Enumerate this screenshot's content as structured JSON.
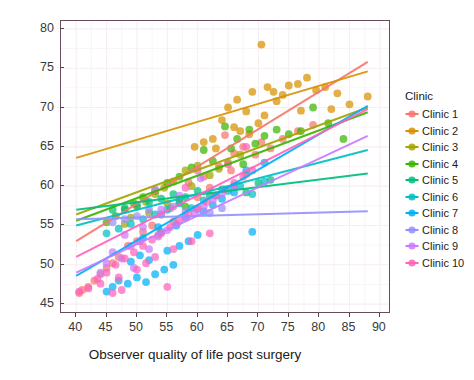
{
  "chart_data": {
    "type": "scatter",
    "title": "",
    "xlabel": "Observer quality of life post surgery",
    "ylabel": "Predicted quality of life post surgery",
    "xlim": [
      37.5,
      91.5
    ],
    "ylim": [
      44.0,
      81.0
    ],
    "xticks": [
      40,
      45,
      50,
      55,
      60,
      65,
      70,
      75,
      80,
      85,
      90
    ],
    "yticks": [
      45,
      50,
      55,
      60,
      65,
      70,
      75,
      80
    ],
    "grid": "minor-and-major faint pink",
    "legend_position": "right",
    "legend_title": "Clinic",
    "panel_border_color": "#6b4a5e",
    "grid_color": "#f7eef1",
    "series": [
      {
        "name": "Clinic 1",
        "color": "#F8766D",
        "fit": {
          "x0": 40,
          "y0": 53.0,
          "x1": 88,
          "y1": 75.8
        },
        "points": [
          [
            64.5,
            66.5
          ],
          [
            66.0,
            64.2
          ],
          [
            67.5,
            65.0
          ],
          [
            69.5,
            64.0
          ],
          [
            70.5,
            65.6
          ],
          [
            72.0,
            64.8
          ],
          [
            63.5,
            62.5
          ],
          [
            65.5,
            62.0
          ],
          [
            61.0,
            61.2
          ],
          [
            62.0,
            59.8
          ],
          [
            58.5,
            60.5
          ],
          [
            60.0,
            58.6
          ],
          [
            57.0,
            58.0
          ],
          [
            55.5,
            57.2
          ],
          [
            54.0,
            56.4
          ],
          [
            56.0,
            55.5
          ],
          [
            52.5,
            55.0
          ],
          [
            53.5,
            53.8
          ],
          [
            51.0,
            54.2
          ],
          [
            50.0,
            53.0
          ],
          [
            48.5,
            52.4
          ],
          [
            47.0,
            51.0
          ],
          [
            46.0,
            50.2
          ],
          [
            45.0,
            49.6
          ],
          [
            44.0,
            48.8
          ],
          [
            43.0,
            48.0
          ],
          [
            42.0,
            47.2
          ],
          [
            41.0,
            46.8
          ],
          [
            40.5,
            46.4
          ],
          [
            68.0,
            61.5
          ],
          [
            74.0,
            66.0
          ],
          [
            76.5,
            67.0
          ],
          [
            79.0,
            67.8
          ]
        ]
      },
      {
        "name": "Clinic 2",
        "color": "#D89000",
        "fit": {
          "x0": 40,
          "y0": 63.6,
          "x1": 88,
          "y1": 74.6
        },
        "points": [
          [
            65.0,
            70.0
          ],
          [
            66.5,
            71.0
          ],
          [
            68.0,
            69.5
          ],
          [
            69.0,
            72.0
          ],
          [
            70.5,
            78.0
          ],
          [
            71.5,
            72.6
          ],
          [
            72.5,
            72.0
          ],
          [
            74.0,
            71.6
          ],
          [
            75.0,
            72.8
          ],
          [
            76.5,
            73.0
          ],
          [
            78.0,
            73.8
          ],
          [
            79.5,
            72.2
          ],
          [
            81.0,
            72.6
          ],
          [
            83.0,
            71.8
          ],
          [
            85.0,
            70.4
          ],
          [
            88.0,
            71.4
          ],
          [
            64.0,
            68.4
          ],
          [
            66.0,
            67.5
          ],
          [
            67.0,
            67.0
          ],
          [
            68.5,
            66.6
          ],
          [
            70.0,
            68.0
          ],
          [
            71.0,
            69.0
          ],
          [
            73.0,
            70.8
          ],
          [
            62.5,
            66.0
          ],
          [
            61.0,
            65.6
          ],
          [
            63.0,
            64.8
          ],
          [
            59.5,
            65.0
          ],
          [
            77.0,
            69.6
          ],
          [
            82.0,
            69.8
          ]
        ]
      },
      {
        "name": "Clinic 3",
        "color": "#A3A500",
        "fit": {
          "x0": 40,
          "y0": 56.4,
          "x1": 88,
          "y1": 70.0
        },
        "points": [
          [
            58.0,
            62.0
          ],
          [
            60.0,
            62.6
          ],
          [
            62.0,
            61.4
          ],
          [
            63.5,
            62.2
          ],
          [
            65.0,
            63.0
          ],
          [
            56.0,
            60.6
          ],
          [
            54.5,
            59.8
          ],
          [
            53.0,
            59.0
          ],
          [
            57.0,
            58.4
          ],
          [
            59.0,
            60.0
          ],
          [
            51.5,
            58.0
          ],
          [
            50.0,
            57.4
          ],
          [
            52.0,
            56.6
          ],
          [
            49.0,
            56.0
          ],
          [
            67.0,
            64.0
          ],
          [
            55.0,
            57.8
          ],
          [
            48.0,
            55.2
          ]
        ]
      },
      {
        "name": "Clinic 4",
        "color": "#39B600",
        "fit": {
          "x0": 40,
          "y0": 55.6,
          "x1": 88,
          "y1": 69.4
        },
        "points": [
          [
            64.5,
            67.6
          ],
          [
            66.5,
            66.0
          ],
          [
            68.5,
            67.2
          ],
          [
            71.0,
            66.4
          ],
          [
            73.0,
            67.2
          ],
          [
            75.0,
            66.6
          ],
          [
            77.0,
            67.0
          ],
          [
            79.0,
            70.0
          ],
          [
            61.0,
            64.6
          ],
          [
            62.5,
            63.2
          ],
          [
            59.0,
            62.4
          ],
          [
            57.0,
            61.2
          ],
          [
            55.0,
            60.4
          ],
          [
            53.0,
            59.4
          ],
          [
            51.0,
            58.6
          ],
          [
            49.5,
            57.8
          ],
          [
            48.0,
            57.0
          ],
          [
            46.5,
            56.2
          ],
          [
            45.0,
            55.4
          ],
          [
            65.5,
            64.8
          ],
          [
            69.5,
            65.4
          ],
          [
            81.5,
            68.0
          ],
          [
            84.0,
            66.0
          ],
          [
            58.0,
            57.4
          ],
          [
            67.5,
            62.8
          ]
        ]
      },
      {
        "name": "Clinic 5",
        "color": "#00BF7D",
        "fit": {
          "x0": 40,
          "y0": 57.0,
          "x1": 88,
          "y1": 61.6
        },
        "points": [
          [
            56.0,
            59.0
          ],
          [
            58.0,
            58.6
          ],
          [
            60.0,
            59.4
          ],
          [
            62.0,
            58.8
          ],
          [
            64.0,
            59.6
          ],
          [
            54.0,
            58.4
          ],
          [
            52.0,
            58.0
          ],
          [
            50.0,
            57.6
          ],
          [
            66.0,
            60.0
          ],
          [
            68.0,
            59.2
          ],
          [
            70.0,
            60.4
          ],
          [
            48.0,
            57.2
          ],
          [
            72.0,
            60.8
          ],
          [
            46.0,
            57.0
          ]
        ]
      },
      {
        "name": "Clinic 6",
        "color": "#00BFC4",
        "fit": {
          "x0": 40,
          "y0": 55.0,
          "x1": 88,
          "y1": 64.6
        },
        "points": [
          [
            55.0,
            57.0
          ],
          [
            57.0,
            57.8
          ],
          [
            59.0,
            57.2
          ],
          [
            61.0,
            58.2
          ],
          [
            53.0,
            56.4
          ],
          [
            51.0,
            55.8
          ],
          [
            49.0,
            55.2
          ],
          [
            63.0,
            58.8
          ],
          [
            65.0,
            59.4
          ],
          [
            47.0,
            54.6
          ],
          [
            45.0,
            54.0
          ],
          [
            67.0,
            60.0
          ],
          [
            69.0,
            59.0
          ],
          [
            71.0,
            60.6
          ]
        ]
      },
      {
        "name": "Clinic 7",
        "color": "#00B0F6",
        "fit": {
          "x0": 40,
          "y0": 48.6,
          "x1": 88,
          "y1": 70.2
        },
        "points": [
          [
            47.0,
            48.0
          ],
          [
            48.5,
            47.6
          ],
          [
            50.0,
            48.4
          ],
          [
            51.5,
            47.8
          ],
          [
            53.0,
            48.8
          ],
          [
            54.5,
            49.4
          ],
          [
            56.0,
            50.0
          ],
          [
            52.0,
            50.6
          ],
          [
            50.5,
            51.2
          ],
          [
            49.0,
            50.4
          ],
          [
            55.0,
            51.8
          ],
          [
            57.0,
            52.4
          ],
          [
            58.5,
            53.0
          ],
          [
            60.0,
            53.8
          ],
          [
            54.0,
            54.2
          ],
          [
            56.5,
            55.0
          ],
          [
            58.0,
            56.0
          ],
          [
            61.0,
            56.8
          ],
          [
            62.5,
            57.6
          ],
          [
            64.0,
            58.4
          ],
          [
            66.0,
            59.2
          ],
          [
            53.5,
            54.8
          ],
          [
            51.0,
            53.4
          ],
          [
            46.0,
            47.2
          ],
          [
            45.0,
            46.6
          ],
          [
            69.0,
            54.2
          ],
          [
            68.0,
            62.0
          ],
          [
            71.0,
            63.0
          ]
        ]
      },
      {
        "name": "Clinic 8",
        "color": "#9590FF",
        "fit": {
          "x0": 40,
          "y0": 55.8,
          "x1": 88,
          "y1": 56.8
        },
        "points": [
          [
            52.0,
            57.0
          ],
          [
            54.0,
            56.4
          ],
          [
            56.0,
            57.4
          ],
          [
            58.0,
            56.8
          ],
          [
            50.0,
            56.2
          ],
          [
            48.0,
            55.8
          ],
          [
            60.0,
            57.0
          ],
          [
            62.0,
            56.6
          ],
          [
            46.0,
            55.4
          ],
          [
            64.0,
            57.2
          ]
        ]
      },
      {
        "name": "Clinic 9",
        "color": "#C77CFF",
        "fit": {
          "x0": 40,
          "y0": 49.0,
          "x1": 88,
          "y1": 66.4
        },
        "points": [
          [
            46.0,
            51.6
          ],
          [
            47.5,
            50.8
          ],
          [
            49.0,
            52.4
          ],
          [
            50.5,
            53.0
          ],
          [
            52.0,
            52.0
          ],
          [
            53.5,
            53.6
          ],
          [
            55.0,
            54.4
          ],
          [
            56.5,
            55.2
          ],
          [
            58.0,
            56.0
          ],
          [
            59.5,
            56.6
          ],
          [
            51.0,
            54.8
          ],
          [
            48.0,
            53.8
          ],
          [
            45.0,
            50.2
          ],
          [
            61.0,
            57.4
          ],
          [
            62.5,
            58.2
          ],
          [
            64.0,
            59.0
          ],
          [
            54.0,
            57.0
          ],
          [
            57.0,
            58.8
          ],
          [
            49.5,
            49.6
          ],
          [
            44.0,
            49.0
          ],
          [
            66.0,
            60.0
          ],
          [
            60.5,
            61.0
          ],
          [
            53.0,
            59.6
          ]
        ]
      },
      {
        "name": "Clinic 10",
        "color": "#FF62BC",
        "fit": {
          "x0": 40,
          "y0": 51.0,
          "x1": 88,
          "y1": 69.8
        },
        "points": [
          [
            40.5,
            46.6
          ],
          [
            42.0,
            47.0
          ],
          [
            43.5,
            48.2
          ],
          [
            45.0,
            49.0
          ],
          [
            46.5,
            50.0
          ],
          [
            48.0,
            50.8
          ],
          [
            49.5,
            51.6
          ],
          [
            51.0,
            52.4
          ],
          [
            52.5,
            53.2
          ],
          [
            54.0,
            54.0
          ],
          [
            55.5,
            54.8
          ],
          [
            57.0,
            55.6
          ],
          [
            58.5,
            56.4
          ],
          [
            60.0,
            57.2
          ],
          [
            61.5,
            58.0
          ],
          [
            63.0,
            58.8
          ],
          [
            64.5,
            59.6
          ],
          [
            66.0,
            60.4
          ],
          [
            50.0,
            49.4
          ],
          [
            47.0,
            48.4
          ],
          [
            44.0,
            47.6
          ],
          [
            53.0,
            51.0
          ],
          [
            56.0,
            52.0
          ],
          [
            59.0,
            53.0
          ],
          [
            62.0,
            54.0
          ],
          [
            55.0,
            47.2
          ],
          [
            67.5,
            61.2
          ],
          [
            69.0,
            62.0
          ],
          [
            51.5,
            50.2
          ],
          [
            58.0,
            59.8
          ],
          [
            65.0,
            62.8
          ],
          [
            60.0,
            62.0
          ],
          [
            68.0,
            65.0
          ],
          [
            47.5,
            46.8
          ],
          [
            46.0,
            46.4
          ]
        ]
      }
    ]
  },
  "legend": {
    "title": "Clinic",
    "items": [
      {
        "label": "Clinic 1",
        "color": "#F8766D"
      },
      {
        "label": "Clinic 2",
        "color": "#D89000"
      },
      {
        "label": "Clinic 3",
        "color": "#A3A500"
      },
      {
        "label": "Clinic 4",
        "color": "#39B600"
      },
      {
        "label": "Clinic 5",
        "color": "#00BF7D"
      },
      {
        "label": "Clinic 6",
        "color": "#00BFC4"
      },
      {
        "label": "Clinic 7",
        "color": "#00B0F6"
      },
      {
        "label": "Clinic 8",
        "color": "#9590FF"
      },
      {
        "label": "Clinic 9",
        "color": "#C77CFF"
      },
      {
        "label": "Clinic 10",
        "color": "#FF62BC"
      }
    ]
  }
}
